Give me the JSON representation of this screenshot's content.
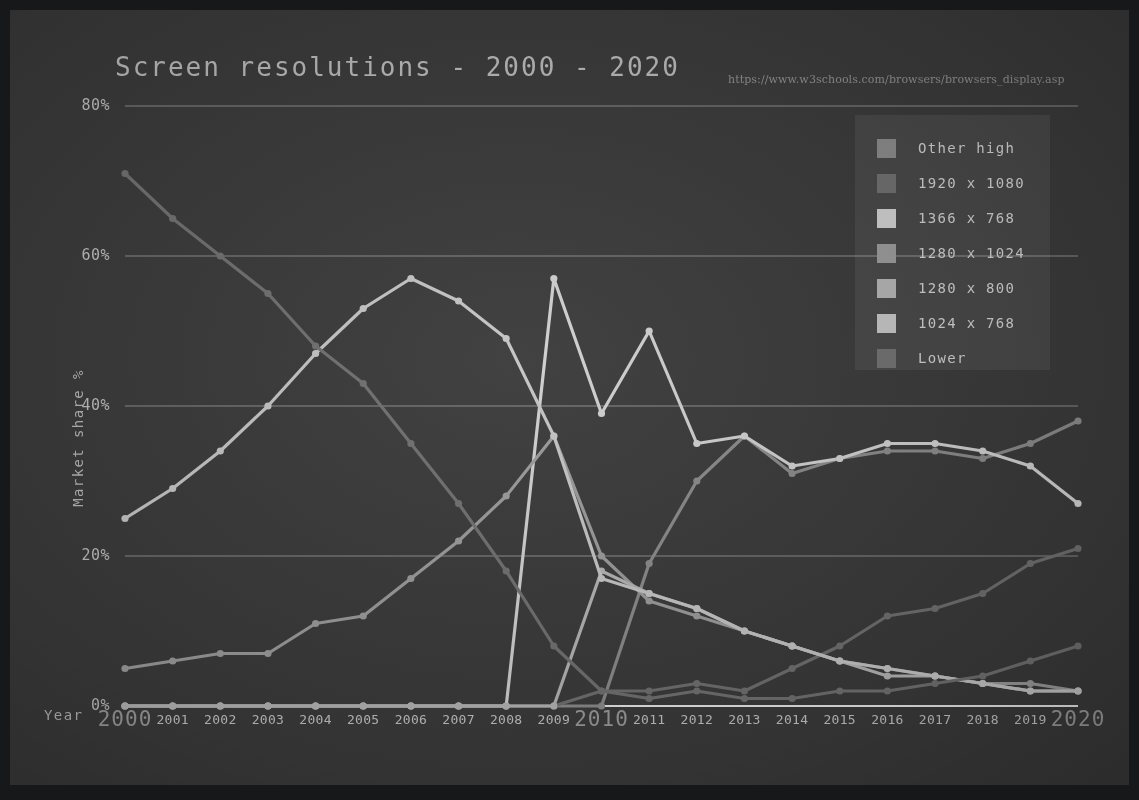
{
  "title": "Screen resolutions - 2000 - 2020",
  "source_url": "https://www.w3schools.com/browsers/browsers_display.asp",
  "axis": {
    "x_title": "Year",
    "y_title": "Market share %"
  },
  "legend": {
    "items": [
      {
        "label": "Other high",
        "color": "#8a8a8a"
      },
      {
        "label": "1920 x 1080",
        "color": "#6f6f6f"
      },
      {
        "label": "1366 x 768",
        "color": "#cfcfcf"
      },
      {
        "label": "1280 x 1024",
        "color": "#9a9a9a"
      },
      {
        "label": "1280 x 800",
        "color": "#b3b3b3"
      },
      {
        "label": "1024 x 768",
        "color": "#c4c4c4"
      },
      {
        "label": "Lower",
        "color": "#707070"
      }
    ]
  },
  "chart_data": {
    "type": "line",
    "title": "Screen resolutions - 2000 - 2020",
    "xlabel": "Year",
    "ylabel": "Market share %",
    "xlim": [
      2000,
      2020
    ],
    "ylim": [
      0,
      80
    ],
    "grid": true,
    "legend_position": "top-right",
    "y_ticks": [
      "0%",
      "20%",
      "40%",
      "60%",
      "80%"
    ],
    "y_tick_values": [
      0,
      20,
      40,
      60,
      80
    ],
    "categories": [
      2000,
      2001,
      2002,
      2003,
      2004,
      2005,
      2006,
      2007,
      2008,
      2009,
      2010,
      2011,
      2012,
      2013,
      2014,
      2015,
      2016,
      2017,
      2018,
      2019,
      2020
    ],
    "decade_ticks": [
      2000,
      2010,
      2020
    ],
    "series": [
      {
        "name": "Other high",
        "color": "#8a8a8a",
        "values": [
          0,
          0,
          0,
          0,
          0,
          0,
          0,
          0,
          0,
          0,
          0,
          19,
          30,
          36,
          31,
          33,
          34,
          34,
          33,
          35,
          38
        ]
      },
      {
        "name": "1920 x 1080",
        "color": "#6f6f6f",
        "values": [
          0,
          0,
          0,
          0,
          0,
          0,
          0,
          0,
          0,
          0,
          2,
          2,
          3,
          2,
          5,
          8,
          12,
          13,
          15,
          19,
          21
        ]
      },
      {
        "name": "1366 x 768",
        "color": "#cfcfcf",
        "values": [
          0,
          0,
          0,
          0,
          0,
          0,
          0,
          0,
          0,
          57,
          39,
          50,
          35,
          36,
          32,
          33,
          35,
          35,
          34,
          32,
          27
        ]
      },
      {
        "name": "1280 x 1024",
        "color": "#9a9a9a",
        "values": [
          5,
          6,
          7,
          7,
          11,
          12,
          17,
          22,
          28,
          36,
          20,
          14,
          12,
          10,
          8,
          6,
          5,
          4,
          3,
          3,
          2
        ]
      },
      {
        "name": "1280 x 800",
        "color": "#b3b3b3",
        "values": [
          0,
          0,
          0,
          0,
          0,
          0,
          0,
          0,
          0,
          0,
          18,
          15,
          13,
          10,
          8,
          6,
          4,
          4,
          3,
          2,
          2
        ]
      },
      {
        "name": "1024 x 768",
        "color": "#c4c4c4",
        "values": [
          25,
          29,
          34,
          40,
          47,
          53,
          57,
          54,
          49,
          36,
          17,
          15,
          13,
          10,
          8,
          6,
          5,
          4,
          3,
          2,
          2
        ]
      },
      {
        "name": "Lower",
        "color": "#707070",
        "values": [
          71,
          65,
          60,
          55,
          48,
          43,
          35,
          27,
          18,
          8,
          2,
          1,
          2,
          1,
          1,
          2,
          2,
          3,
          4,
          6,
          8
        ]
      }
    ]
  }
}
